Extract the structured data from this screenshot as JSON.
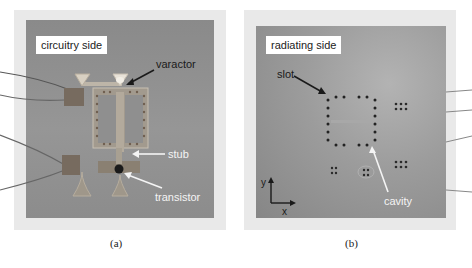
{
  "figure": {
    "panel_a": {
      "label": "circuitry side",
      "annotations": {
        "varactor": "varactor",
        "stub": "stub",
        "transistor": "transistor"
      },
      "caption": "(a)"
    },
    "panel_b": {
      "label": "radiating side",
      "annotations": {
        "slot": "slot",
        "cavity": "cavity"
      },
      "axes": {
        "y": "y",
        "x": "x"
      },
      "caption": "(b)"
    }
  },
  "colors": {
    "board": "#8f8f8f",
    "frame": "#e8e8e8",
    "arrow_dark": "#1a1a1a",
    "arrow_light": "#f4f4f4"
  }
}
